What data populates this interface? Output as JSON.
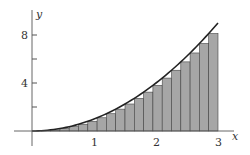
{
  "chart_data": {
    "type": "bar",
    "title": "",
    "function": "x^2",
    "xlabel": "x",
    "ylabel": "y",
    "xlim": [
      0,
      3
    ],
    "ylim": [
      0,
      9
    ],
    "x_ticks": [
      "1",
      "2",
      "3"
    ],
    "y_ticks": [
      "4",
      "8"
    ],
    "n_rectangles": 20,
    "bar_width": 0.15,
    "categories": [
      "0",
      "0.15",
      "0.3",
      "0.45",
      "0.6",
      "0.75",
      "0.9",
      "1.05",
      "1.2",
      "1.35",
      "1.5",
      "1.65",
      "1.8",
      "1.95",
      "2.1",
      "2.25",
      "2.4",
      "2.55",
      "2.7",
      "2.85"
    ],
    "values": [
      0,
      0.0225,
      0.09,
      0.2025,
      0.36,
      0.5625,
      0.81,
      1.1025,
      1.44,
      1.8225,
      2.25,
      2.7225,
      3.24,
      3.8025,
      4.41,
      5.0625,
      5.76,
      6.5025,
      7.29,
      8.1225
    ],
    "grid": false,
    "colors": {
      "bar_fill": "#a6a6a6",
      "bar_stroke": "#444444",
      "curve": "#222222",
      "axis": "#555555"
    }
  },
  "axes": {
    "x_label": "x",
    "y_label": "y",
    "x_ticks": [
      "1",
      "2",
      "3"
    ],
    "y_ticks": [
      "4",
      "8"
    ]
  }
}
